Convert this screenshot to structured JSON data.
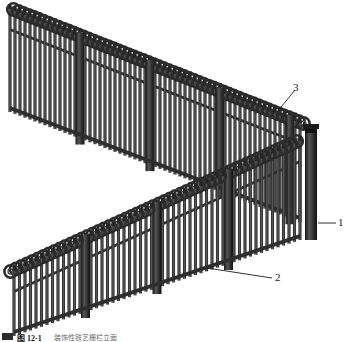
{
  "figure": {
    "background_color": "#ffffff",
    "ink_color": "#3a3a3a",
    "dark_color": "#2b2b2b",
    "callout_color": "#1a1a1a"
  },
  "callouts": [
    {
      "id": "1",
      "label": "1",
      "target": "corner-post",
      "leader": "horizontal"
    },
    {
      "id": "2",
      "label": "2",
      "target": "lower-fence-run-pickets",
      "leader": "diagonal-up-left"
    },
    {
      "id": "3",
      "label": "3",
      "target": "loop-scroll-top",
      "leader": "diagonal-down-left"
    }
  ],
  "caption": {
    "marker": "figure-marker",
    "number": "图 12-1",
    "text": "装饰性铁艺栅栏立面"
  }
}
